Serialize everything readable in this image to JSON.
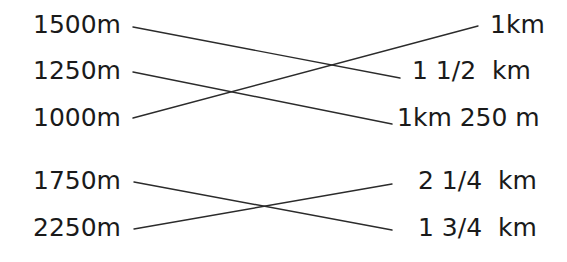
{
  "worksheet": {
    "type": "matching-exercise",
    "background_color": "#ffffff",
    "text_color": "#1a1a1a",
    "line_color": "#2b2b2b",
    "groups": [
      {
        "name": "upper-group",
        "left_labels": [
          {
            "text": "1500m",
            "x": 33,
            "y": 12
          },
          {
            "text": "1250m",
            "x": 33,
            "y": 58
          },
          {
            "text": "1000m",
            "x": 33,
            "y": 105
          }
        ],
        "right_labels": [
          {
            "text": "1km",
            "x": 490,
            "y": 12
          },
          {
            "text": "1 1/2  km",
            "x": 412,
            "y": 58
          },
          {
            "text": "1km 250 m",
            "x": 397,
            "y": 105
          }
        ],
        "connections": [
          {
            "from": "1500m",
            "to": "1 1/2  km",
            "x1": 133,
            "y1": 27,
            "x2": 400,
            "y2": 78
          },
          {
            "from": "1250m",
            "to": "1km 250 m",
            "x1": 133,
            "y1": 72,
            "x2": 392,
            "y2": 124
          },
          {
            "from": "1000m",
            "to": "1km",
            "x1": 133,
            "y1": 118,
            "x2": 478,
            "y2": 26
          }
        ]
      },
      {
        "name": "lower-group",
        "left_labels": [
          {
            "text": "1750m",
            "x": 33,
            "y": 168
          },
          {
            "text": "2250m",
            "x": 33,
            "y": 215
          }
        ],
        "right_labels": [
          {
            "text": "2 1/4  km",
            "x": 418,
            "y": 168
          },
          {
            "text": "1 3/4  km",
            "x": 418,
            "y": 215
          }
        ],
        "connections": [
          {
            "from": "1750m",
            "to": "1 3/4  km",
            "x1": 134,
            "y1": 182,
            "x2": 392,
            "y2": 230
          },
          {
            "from": "2250m",
            "to": "2 1/4  km",
            "x1": 134,
            "y1": 229,
            "x2": 392,
            "y2": 184
          }
        ]
      }
    ]
  }
}
